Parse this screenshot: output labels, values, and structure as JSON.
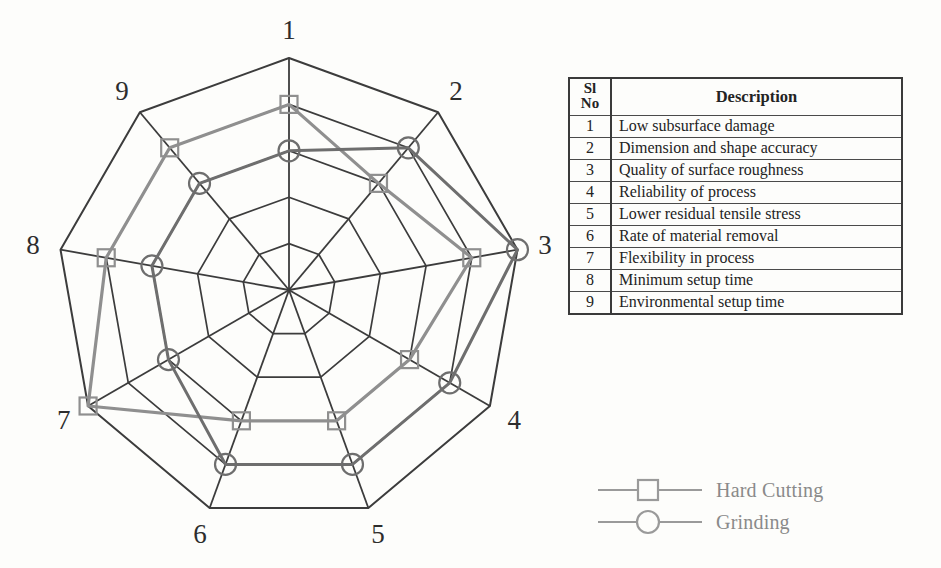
{
  "chart_data": {
    "type": "radar",
    "title": "",
    "categories": [
      "1",
      "2",
      "3",
      "4",
      "5",
      "6",
      "7",
      "8",
      "9"
    ],
    "category_descriptions": [
      "Low subsurface damage",
      "Dimension and shape accuracy",
      "Quality of surface roughness",
      "Reliability of process",
      "Lower residual tensile stress",
      "Rate of material removal",
      "Flexibility in process",
      "Minimum setup time",
      "Environmental setup time"
    ],
    "rings": 5,
    "rlim": [
      0,
      5
    ],
    "grid": true,
    "legend_position": "bottom-right",
    "series": [
      {
        "name": "Hard Cutting",
        "marker": "square",
        "color": "#8f8f8f",
        "values": [
          4,
          3,
          4,
          3,
          3,
          3,
          5,
          4,
          4
        ]
      },
      {
        "name": "Grinding",
        "marker": "circle",
        "color": "#6e6e6e",
        "values": [
          3,
          4,
          5,
          4,
          4,
          4,
          3,
          3,
          3
        ]
      }
    ],
    "xlabel": "",
    "ylabel": ""
  },
  "table": {
    "header": {
      "sl_line1": "Sl",
      "sl_line2": "No",
      "description": "Description"
    },
    "rows": [
      {
        "no": "1",
        "description": "Low subsurface damage"
      },
      {
        "no": "2",
        "description": "Dimension and shape accuracy"
      },
      {
        "no": "3",
        "description": "Quality of surface roughness"
      },
      {
        "no": "4",
        "description": "Reliability of process"
      },
      {
        "no": "5",
        "description": "Lower residual tensile stress"
      },
      {
        "no": "6",
        "description": "Rate of material removal"
      },
      {
        "no": "7",
        "description": "Flexibility in process"
      },
      {
        "no": "8",
        "description": "Minimum setup time"
      },
      {
        "no": "9",
        "description": "Environmental setup time"
      }
    ]
  },
  "legend": {
    "items": [
      {
        "label": "Hard Cutting",
        "marker": "square",
        "color": "#9a9a9a"
      },
      {
        "label": "Grinding",
        "marker": "circle",
        "color": "#9a9a9a"
      }
    ]
  },
  "colors": {
    "grid": "#3c3c3c",
    "hard_cutting": "#8f8f8f",
    "grinding": "#6e6e6e",
    "text": "#232323",
    "background": "#fdfdfb"
  }
}
